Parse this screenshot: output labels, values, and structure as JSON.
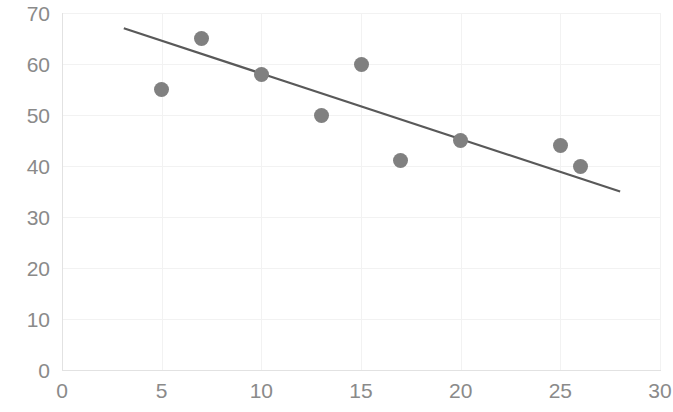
{
  "chart_data": {
    "type": "scatter",
    "title": "",
    "subtitle": "",
    "xlabel": "",
    "ylabel": "",
    "xlim": [
      0,
      30
    ],
    "ylim": [
      0,
      70
    ],
    "x_ticks": [
      0,
      5,
      10,
      15,
      20,
      25,
      30
    ],
    "y_ticks": [
      0,
      10,
      20,
      30,
      40,
      50,
      60,
      70
    ],
    "x_tick_labels": [
      "0",
      "5",
      "10",
      "15",
      "20",
      "25",
      "30"
    ],
    "y_tick_labels": [
      "0",
      "10",
      "20",
      "30",
      "40",
      "50",
      "60",
      "70"
    ],
    "grid": true,
    "legend": false,
    "legend_position": "none",
    "marker_color": "#808080",
    "trendline_color": "#595959",
    "gridline_color": "#f2f2f2",
    "axis_color": "#e2e2e2",
    "tick_label_color": "#8a8a8a",
    "points": [
      {
        "x": 5,
        "y": 55
      },
      {
        "x": 7,
        "y": 65
      },
      {
        "x": 10,
        "y": 58
      },
      {
        "x": 13,
        "y": 50
      },
      {
        "x": 15,
        "y": 60
      },
      {
        "x": 17,
        "y": 41
      },
      {
        "x": 20,
        "y": 45
      },
      {
        "x": 25,
        "y": 44
      },
      {
        "x": 26,
        "y": 40
      }
    ],
    "x": [
      5,
      7,
      10,
      13,
      15,
      17,
      20,
      25,
      26
    ],
    "values": [
      55,
      65,
      58,
      50,
      60,
      41,
      45,
      44,
      40
    ],
    "trendline": {
      "type": "linear",
      "x_start": 3.1,
      "y_start": 67,
      "x_end": 28.0,
      "y_end": 35
    }
  }
}
